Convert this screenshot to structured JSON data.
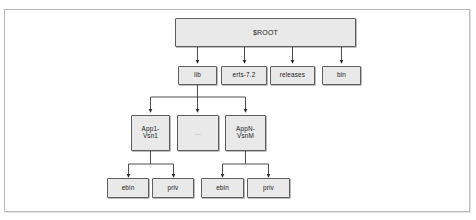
{
  "figure": {
    "background_color": "#ffffff",
    "frame_border_color": "#b8b8b8",
    "node_fill_color": "#e9e9e9",
    "node_border_color": "#5e5e5e",
    "link_color": "#3a3a3a"
  },
  "nodes": {
    "root": {
      "label": "$ROOT"
    },
    "lib": {
      "label": "lib"
    },
    "erts": {
      "label": "erts-7.2"
    },
    "releases": {
      "label": "releases"
    },
    "bin": {
      "label": "bin"
    },
    "app1": {
      "label": "App1-\nVsn1"
    },
    "appmid": {
      "label": "..."
    },
    "appn": {
      "label": "AppN-\nVsnM"
    },
    "ebin1": {
      "label": "ebin"
    },
    "priv1": {
      "label": "priv"
    },
    "ebin2": {
      "label": "ebin"
    },
    "priv2": {
      "label": "priv"
    }
  },
  "tree": {
    "root_children": [
      "lib",
      "erts-7.2",
      "releases",
      "bin"
    ],
    "lib_children": [
      "App1-Vsn1",
      "...",
      "AppN-VsnM"
    ],
    "app1_children": [
      "ebin",
      "priv"
    ],
    "appn_children": [
      "ebin",
      "priv"
    ]
  }
}
